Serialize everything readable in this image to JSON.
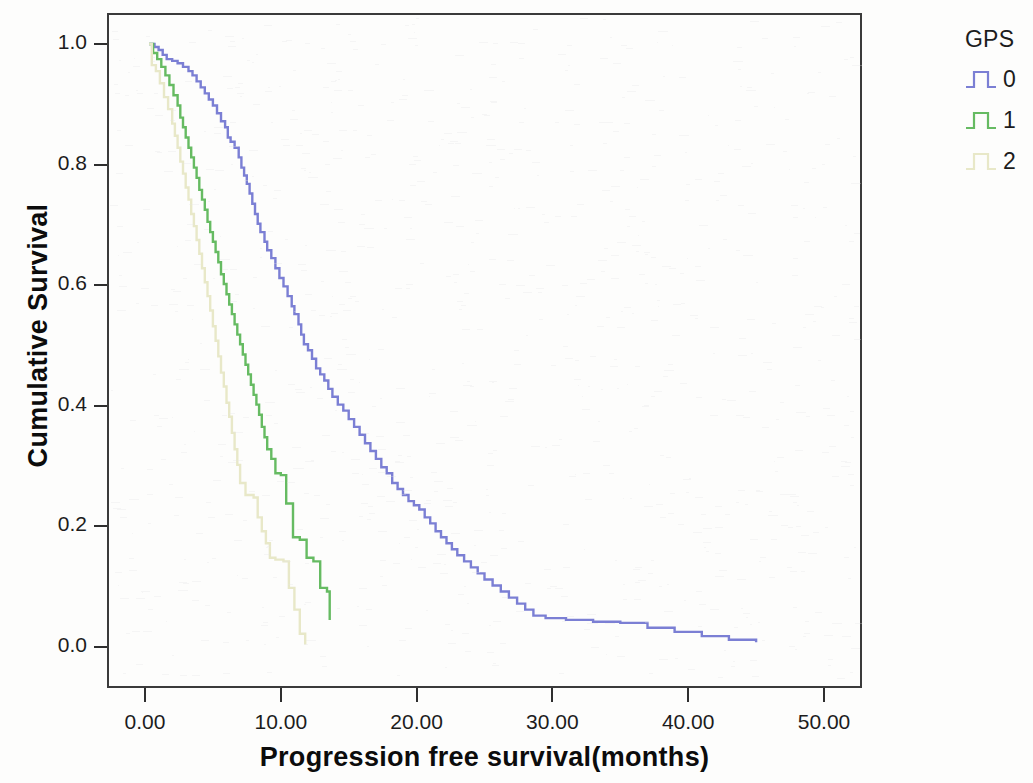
{
  "chart_data": {
    "type": "line",
    "title": "",
    "subtitle": "",
    "xlabel": "Progression free survival(months)",
    "ylabel": "Cumulative Survival",
    "xlim": [
      -1.5,
      53.5
    ],
    "ylim": [
      -0.055,
      1.05
    ],
    "xticks": [
      "0.00",
      "10.00",
      "20.00",
      "30.00",
      "40.00",
      "50.00"
    ],
    "xtick_values": [
      0,
      10,
      20,
      30,
      40,
      50
    ],
    "yticks": [
      "1.0",
      "0.8",
      "0.6",
      "0.4",
      "0.2",
      "0.0"
    ],
    "ytick_values": [
      1.0,
      0.8,
      0.6,
      0.4,
      0.2,
      0.0
    ],
    "grid": false,
    "legend_position": "right",
    "legend_title": "GPS",
    "plot_style": "kaplan-meier step (survival function)",
    "series": [
      {
        "name": "0",
        "color": "#7b7fd4",
        "points": [
          [
            0.3,
            1.0
          ],
          [
            0.7,
            0.995
          ],
          [
            1.0,
            0.99
          ],
          [
            1.3,
            0.982
          ],
          [
            1.6,
            0.975
          ],
          [
            2.0,
            0.972
          ],
          [
            2.4,
            0.968
          ],
          [
            2.8,
            0.962
          ],
          [
            3.2,
            0.955
          ],
          [
            3.5,
            0.948
          ],
          [
            3.8,
            0.938
          ],
          [
            4.1,
            0.928
          ],
          [
            4.4,
            0.918
          ],
          [
            4.7,
            0.908
          ],
          [
            5.0,
            0.898
          ],
          [
            5.3,
            0.885
          ],
          [
            5.6,
            0.872
          ],
          [
            5.9,
            0.862
          ],
          [
            6.1,
            0.845
          ],
          [
            6.3,
            0.838
          ],
          [
            6.6,
            0.828
          ],
          [
            6.9,
            0.812
          ],
          [
            7.1,
            0.795
          ],
          [
            7.3,
            0.782
          ],
          [
            7.5,
            0.768
          ],
          [
            7.7,
            0.752
          ],
          [
            7.9,
            0.735
          ],
          [
            8.1,
            0.718
          ],
          [
            8.3,
            0.702
          ],
          [
            8.5,
            0.688
          ],
          [
            8.8,
            0.672
          ],
          [
            9.0,
            0.658
          ],
          [
            9.3,
            0.645
          ],
          [
            9.6,
            0.628
          ],
          [
            9.9,
            0.612
          ],
          [
            10.2,
            0.598
          ],
          [
            10.5,
            0.582
          ],
          [
            10.8,
            0.565
          ],
          [
            11.0,
            0.552
          ],
          [
            11.3,
            0.535
          ],
          [
            11.5,
            0.518
          ],
          [
            11.7,
            0.502
          ],
          [
            12.0,
            0.492
          ],
          [
            12.3,
            0.478
          ],
          [
            12.6,
            0.462
          ],
          [
            12.9,
            0.452
          ],
          [
            13.2,
            0.442
          ],
          [
            13.5,
            0.428
          ],
          [
            13.8,
            0.415
          ],
          [
            14.2,
            0.402
          ],
          [
            14.6,
            0.392
          ],
          [
            15.0,
            0.378
          ],
          [
            15.4,
            0.365
          ],
          [
            15.8,
            0.352
          ],
          [
            16.2,
            0.338
          ],
          [
            16.6,
            0.325
          ],
          [
            17.0,
            0.312
          ],
          [
            17.4,
            0.298
          ],
          [
            17.8,
            0.288
          ],
          [
            18.2,
            0.272
          ],
          [
            18.6,
            0.262
          ],
          [
            19.0,
            0.252
          ],
          [
            19.4,
            0.242
          ],
          [
            19.8,
            0.235
          ],
          [
            20.2,
            0.228
          ],
          [
            20.6,
            0.215
          ],
          [
            21.0,
            0.205
          ],
          [
            21.4,
            0.192
          ],
          [
            21.8,
            0.182
          ],
          [
            22.2,
            0.172
          ],
          [
            22.6,
            0.162
          ],
          [
            23.0,
            0.152
          ],
          [
            23.5,
            0.142
          ],
          [
            24.0,
            0.132
          ],
          [
            24.5,
            0.122
          ],
          [
            25.0,
            0.112
          ],
          [
            25.6,
            0.102
          ],
          [
            26.2,
            0.092
          ],
          [
            26.8,
            0.082
          ],
          [
            27.4,
            0.072
          ],
          [
            28.0,
            0.062
          ],
          [
            28.6,
            0.052
          ],
          [
            29.5,
            0.048
          ],
          [
            31.0,
            0.045
          ],
          [
            33.0,
            0.042
          ],
          [
            35.0,
            0.04
          ],
          [
            37.0,
            0.032
          ],
          [
            39.0,
            0.025
          ],
          [
            41.0,
            0.018
          ],
          [
            43.0,
            0.012
          ],
          [
            45.0,
            0.008
          ]
        ]
      },
      {
        "name": "1",
        "color": "#66bb62",
        "points": [
          [
            0.3,
            1.0
          ],
          [
            0.6,
            0.985
          ],
          [
            0.9,
            0.975
          ],
          [
            1.2,
            0.962
          ],
          [
            1.5,
            0.948
          ],
          [
            1.8,
            0.932
          ],
          [
            2.1,
            0.915
          ],
          [
            2.4,
            0.898
          ],
          [
            2.6,
            0.878
          ],
          [
            2.8,
            0.862
          ],
          [
            3.0,
            0.845
          ],
          [
            3.2,
            0.828
          ],
          [
            3.4,
            0.812
          ],
          [
            3.6,
            0.795
          ],
          [
            3.8,
            0.778
          ],
          [
            4.0,
            0.758
          ],
          [
            4.2,
            0.742
          ],
          [
            4.4,
            0.725
          ],
          [
            4.6,
            0.705
          ],
          [
            4.8,
            0.688
          ],
          [
            5.0,
            0.672
          ],
          [
            5.2,
            0.655
          ],
          [
            5.4,
            0.638
          ],
          [
            5.6,
            0.618
          ],
          [
            5.8,
            0.602
          ],
          [
            6.0,
            0.585
          ],
          [
            6.2,
            0.568
          ],
          [
            6.4,
            0.552
          ],
          [
            6.6,
            0.535
          ],
          [
            6.8,
            0.518
          ],
          [
            7.0,
            0.502
          ],
          [
            7.2,
            0.485
          ],
          [
            7.4,
            0.468
          ],
          [
            7.6,
            0.452
          ],
          [
            7.8,
            0.435
          ],
          [
            8.0,
            0.418
          ],
          [
            8.2,
            0.402
          ],
          [
            8.4,
            0.385
          ],
          [
            8.6,
            0.365
          ],
          [
            8.8,
            0.348
          ],
          [
            9.0,
            0.328
          ],
          [
            9.3,
            0.312
          ],
          [
            9.6,
            0.288
          ],
          [
            10.0,
            0.285
          ],
          [
            10.4,
            0.238
          ],
          [
            10.9,
            0.182
          ],
          [
            11.4,
            0.178
          ],
          [
            11.9,
            0.148
          ],
          [
            12.4,
            0.142
          ],
          [
            12.9,
            0.098
          ],
          [
            13.4,
            0.092
          ],
          [
            13.6,
            0.045
          ]
        ]
      },
      {
        "name": "2",
        "color": "#e8e8c8",
        "points": [
          [
            0.3,
            1.0
          ],
          [
            0.5,
            0.965
          ],
          [
            0.8,
            0.955
          ],
          [
            1.1,
            0.935
          ],
          [
            1.4,
            0.912
          ],
          [
            1.7,
            0.892
          ],
          [
            2.0,
            0.868
          ],
          [
            2.2,
            0.848
          ],
          [
            2.4,
            0.828
          ],
          [
            2.6,
            0.805
          ],
          [
            2.8,
            0.785
          ],
          [
            3.0,
            0.762
          ],
          [
            3.2,
            0.742
          ],
          [
            3.4,
            0.718
          ],
          [
            3.6,
            0.698
          ],
          [
            3.8,
            0.675
          ],
          [
            4.0,
            0.652
          ],
          [
            4.2,
            0.628
          ],
          [
            4.4,
            0.605
          ],
          [
            4.6,
            0.582
          ],
          [
            4.8,
            0.558
          ],
          [
            5.0,
            0.532
          ],
          [
            5.2,
            0.508
          ],
          [
            5.4,
            0.482
          ],
          [
            5.6,
            0.455
          ],
          [
            5.8,
            0.432
          ],
          [
            6.0,
            0.405
          ],
          [
            6.2,
            0.382
          ],
          [
            6.4,
            0.355
          ],
          [
            6.6,
            0.328
          ],
          [
            6.8,
            0.302
          ],
          [
            7.0,
            0.272
          ],
          [
            7.4,
            0.252
          ],
          [
            8.0,
            0.248
          ],
          [
            8.3,
            0.215
          ],
          [
            8.6,
            0.192
          ],
          [
            8.9,
            0.172
          ],
          [
            9.2,
            0.148
          ],
          [
            9.6,
            0.145
          ],
          [
            10.2,
            0.142
          ],
          [
            10.6,
            0.098
          ],
          [
            11.0,
            0.062
          ],
          [
            11.4,
            0.022
          ],
          [
            11.8,
            0.004
          ]
        ]
      }
    ]
  },
  "legend": {
    "title": "GPS",
    "entries": [
      {
        "label": "0",
        "color": "#7b7fd4"
      },
      {
        "label": "1",
        "color": "#66bb62"
      },
      {
        "label": "2",
        "color": "#e8e8c8"
      }
    ]
  },
  "axes": {
    "x_title": "Progression free survival(months)",
    "y_title": "Cumulative Survival"
  }
}
